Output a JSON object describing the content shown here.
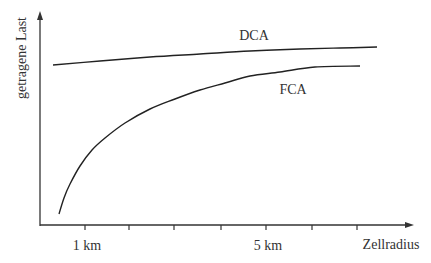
{
  "chart_data": {
    "type": "line",
    "title": "",
    "xlabel": "Zellradius",
    "ylabel": "getragene Last",
    "x_tick_labels": [
      {
        "label": "1 km",
        "x_px": 85
      },
      {
        "label": "5 km",
        "x_px": 266
      }
    ],
    "x_ticks_px": [
      85,
      129,
      174,
      221,
      266,
      312,
      357
    ],
    "grid": false,
    "legend": "inline labels on curves",
    "series": [
      {
        "name": "DCA",
        "label_pos": [
          226,
          40
        ],
        "points_px": [
          [
            53,
            65
          ],
          [
            100,
            61
          ],
          [
            150,
            57
          ],
          [
            200,
            54
          ],
          [
            250,
            51
          ],
          [
            300,
            49
          ],
          [
            340,
            48
          ],
          [
            377,
            47
          ]
        ]
      },
      {
        "name": "FCA",
        "label_pos": [
          281,
          93
        ],
        "points_px": [
          [
            59,
            214
          ],
          [
            64,
            198
          ],
          [
            70,
            184
          ],
          [
            80,
            166
          ],
          [
            92,
            150
          ],
          [
            105,
            138
          ],
          [
            125,
            123
          ],
          [
            150,
            109
          ],
          [
            175,
            99
          ],
          [
            200,
            90
          ],
          [
            225,
            83
          ],
          [
            250,
            76
          ],
          [
            280,
            72
          ],
          [
            315,
            67
          ],
          [
            360,
            66
          ]
        ]
      }
    ],
    "annotations": [
      "DCA",
      "FCA"
    ]
  },
  "labels": {
    "ylabel": "getragene Last",
    "xlabel": "Zellradius",
    "tick_1km": "1 km",
    "tick_5km": "5 km",
    "dca": "DCA",
    "fca": "FCA"
  }
}
